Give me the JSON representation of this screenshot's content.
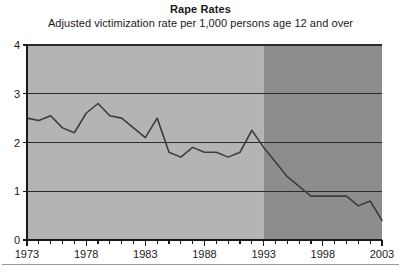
{
  "chart_data": {
    "type": "line",
    "title": "Rape Rates",
    "subtitle": "Adjusted victimization rate per 1,000 persons age 12 and over",
    "xlabel": "",
    "ylabel": "",
    "xlim": [
      1973,
      2003
    ],
    "ylim": [
      0,
      4
    ],
    "yticks": [
      0,
      1,
      2,
      3,
      4
    ],
    "ytick_labels": [
      "0",
      "1",
      "2",
      "3",
      "4"
    ],
    "xticks": [
      1973,
      1978,
      1983,
      1988,
      1993,
      1998,
      2003
    ],
    "xtick_labels": [
      "1973",
      "1978",
      "1983",
      "1988",
      "1993",
      "1998",
      "2003"
    ],
    "xtick_minor_interval": 1,
    "grid": "horizontal",
    "legend": "none",
    "line_color": "#3d3d3d",
    "line_width": 1.6,
    "plot_bg_light": "#b4b4b4",
    "plot_bg_dark": "#8d8d8d",
    "shade_split_year": 1993,
    "axis_color": "#1a1a1a",
    "x": [
      1973,
      1974,
      1975,
      1976,
      1977,
      1978,
      1979,
      1980,
      1981,
      1982,
      1983,
      1984,
      1985,
      1986,
      1987,
      1988,
      1989,
      1990,
      1991,
      1992,
      1993,
      1994,
      1995,
      1996,
      1997,
      1998,
      1999,
      2000,
      2001,
      2002,
      2003
    ],
    "values": [
      2.5,
      2.45,
      2.55,
      2.3,
      2.2,
      2.6,
      2.8,
      2.55,
      2.5,
      2.3,
      2.1,
      2.5,
      1.8,
      1.7,
      1.9,
      1.8,
      1.8,
      1.7,
      1.8,
      2.25,
      1.9,
      1.6,
      1.3,
      1.1,
      0.9,
      0.9,
      0.9,
      0.9,
      0.7,
      0.8,
      0.4
    ],
    "series": [
      {
        "name": "Adjusted victimization rate per 1,000 persons age 12 and over",
        "values": [
          2.5,
          2.45,
          2.55,
          2.3,
          2.2,
          2.6,
          2.8,
          2.55,
          2.5,
          2.3,
          2.1,
          2.5,
          1.8,
          1.7,
          1.9,
          1.8,
          1.8,
          1.7,
          1.8,
          2.25,
          1.9,
          1.6,
          1.3,
          1.1,
          0.9,
          0.9,
          0.9,
          0.9,
          0.7,
          0.8,
          0.4
        ]
      }
    ]
  }
}
